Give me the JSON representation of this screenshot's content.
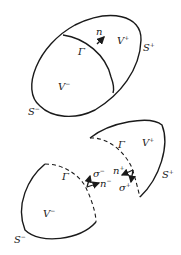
{
  "diagram": {
    "top": {
      "labels": {
        "n": "n",
        "gamma": "Γ",
        "v_plus": "V",
        "v_plus_sup": "+",
        "v_minus": "V",
        "v_minus_sup": "−",
        "s_plus": "S",
        "s_plus_sup": "+",
        "s_minus": "S",
        "s_minus_sup": "−"
      }
    },
    "bottom": {
      "labels": {
        "gamma_left": "Γ",
        "gamma_right": "Γ",
        "v_plus": "V",
        "v_plus_sup": "+",
        "v_minus": "V",
        "v_minus_sup": "−",
        "s_plus": "S",
        "s_plus_sup": "+",
        "s_minus": "S",
        "s_minus_sup": "−",
        "sigma_minus": "σ",
        "sigma_minus_sup": "−",
        "n_minus": "n",
        "n_minus_sup": "−",
        "n_plus": "n",
        "n_plus_sup": "+",
        "sigma_plus": "σ",
        "sigma_plus_sup": "+"
      }
    },
    "colors": {
      "stroke": "#1a1a1a",
      "background": "#ffffff"
    }
  }
}
